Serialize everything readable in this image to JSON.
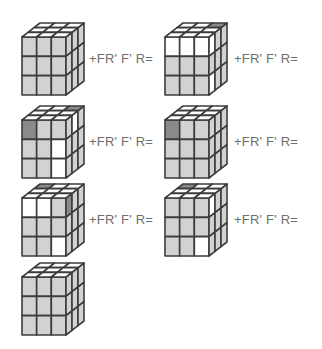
{
  "caption": "ᐩᐩᐩ ᐩᐩᐩᐩᐩᐩ",
  "colors": {
    "w": "#ffffff",
    "g": "#d2d2d2",
    "d": "#8a8a8a",
    "edge": "#3c3c3c"
  },
  "formula_text": "+FR' F' R=",
  "cubes": [
    {
      "id": "cube-1",
      "top": [
        "w",
        "w",
        "w",
        "w",
        "w",
        "w",
        "w",
        "w",
        "w"
      ],
      "front": [
        "g",
        "g",
        "g",
        "g",
        "g",
        "g",
        "g",
        "g",
        "g"
      ],
      "right": [
        "g",
        "g",
        "g",
        "g",
        "g",
        "g",
        "g",
        "g",
        "g"
      ],
      "formula": "+FR' F' R="
    },
    {
      "id": "cube-2",
      "top": [
        "w",
        "w",
        "d",
        "w",
        "w",
        "w",
        "w",
        "w",
        "w"
      ],
      "front": [
        "w",
        "w",
        "w",
        "g",
        "g",
        "g",
        "g",
        "g",
        "g"
      ],
      "right": [
        "w",
        "g",
        "g",
        "g",
        "g",
        "g",
        "w",
        "g",
        "g"
      ],
      "formula": "+FR' F' R="
    },
    {
      "id": "cube-3",
      "top": [
        "w",
        "w",
        "d",
        "w",
        "w",
        "w",
        "w",
        "w",
        "w"
      ],
      "front": [
        "d",
        "g",
        "g",
        "g",
        "g",
        "w",
        "g",
        "g",
        "w"
      ],
      "right": [
        "g",
        "w",
        "g",
        "g",
        "g",
        "g",
        "g",
        "g",
        "g"
      ],
      "formula": "+FR' F' R="
    },
    {
      "id": "cube-4",
      "top": [
        "w",
        "w",
        "w",
        "w",
        "w",
        "w",
        "w",
        "w",
        "w"
      ],
      "front": [
        "d",
        "g",
        "g",
        "g",
        "g",
        "g",
        "g",
        "g",
        "g"
      ],
      "right": [
        "g",
        "g",
        "g",
        "g",
        "g",
        "g",
        "g",
        "g",
        "g"
      ],
      "formula": "+FR' F' R="
    },
    {
      "id": "cube-5",
      "top": [
        "d",
        "w",
        "w",
        "w",
        "w",
        "w",
        "w",
        "w",
        "w"
      ],
      "front": [
        "w",
        "w",
        "g",
        "g",
        "g",
        "g",
        "g",
        "g",
        "w"
      ],
      "right": [
        "d",
        "g",
        "g",
        "g",
        "g",
        "g",
        "g",
        "g",
        "g"
      ],
      "formula": "+FR' F' R="
    },
    {
      "id": "cube-6",
      "top": [
        "d",
        "w",
        "w",
        "w",
        "w",
        "w",
        "w",
        "w",
        "w"
      ],
      "front": [
        "g",
        "g",
        "g",
        "g",
        "g",
        "g",
        "g",
        "g",
        "w"
      ],
      "right": [
        "w",
        "g",
        "g",
        "g",
        "g",
        "g",
        "g",
        "g",
        "g"
      ],
      "formula": "+FR' F' R="
    },
    {
      "id": "cube-7",
      "top": [
        "w",
        "w",
        "w",
        "w",
        "w",
        "w",
        "w",
        "w",
        "w"
      ],
      "front": [
        "g",
        "g",
        "g",
        "g",
        "g",
        "g",
        "g",
        "g",
        "g"
      ],
      "right": [
        "g",
        "g",
        "g",
        "g",
        "g",
        "g",
        "g",
        "g",
        "g"
      ],
      "formula": ""
    }
  ]
}
